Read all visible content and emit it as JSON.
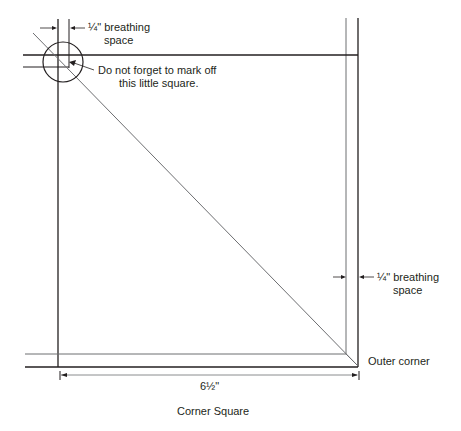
{
  "diagram": {
    "caption": "Corner Square",
    "labels": {
      "top_breathing_line1": "¼\" breathing",
      "top_breathing_line2": "space",
      "note_line1": "Do not forget to mark off",
      "note_line2": "this little square.",
      "right_breathing_line1": "¼\" breathing",
      "right_breathing_line2": "space",
      "outer_corner": "Outer corner",
      "dimension": "6½\""
    },
    "colors": {
      "line": "#231f20",
      "light_line": "#6d6e71",
      "background": "#ffffff"
    }
  }
}
